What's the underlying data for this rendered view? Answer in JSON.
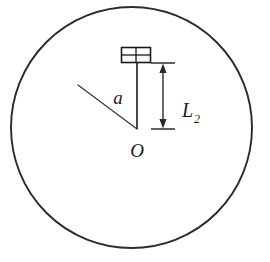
{
  "figure": {
    "background_color": "#ffffff",
    "stroke_color": "#2b2b2b",
    "text_color": "#1a1a1a",
    "labels": {
      "radius_label": "a",
      "distance_label": "L",
      "distance_subscript": "2",
      "center_label": "O"
    },
    "geometry": {
      "circle": {
        "center_x": 131.5,
        "center_y": 127.5,
        "radius": 120.5,
        "stroke_width": 1.8
      },
      "center_point": {
        "x": 137,
        "y": 129
      },
      "radius_line": {
        "x1": 78,
        "y1": 85,
        "x2": 137,
        "y2": 129,
        "stroke_width": 1.3
      },
      "vertical_line": {
        "x1": 137,
        "y1": 63,
        "x2": 137,
        "y2": 129,
        "stroke_width": 1.6
      },
      "block": {
        "x": 121,
        "y": 47,
        "width": 30,
        "height": 16,
        "rows": 2,
        "cols": 2,
        "stroke_width": 1.5
      },
      "dimension": {
        "x": 163,
        "top_y": 63,
        "bottom_y": 129,
        "tick_half_width": 12,
        "stroke_width": 1.4
      }
    }
  }
}
